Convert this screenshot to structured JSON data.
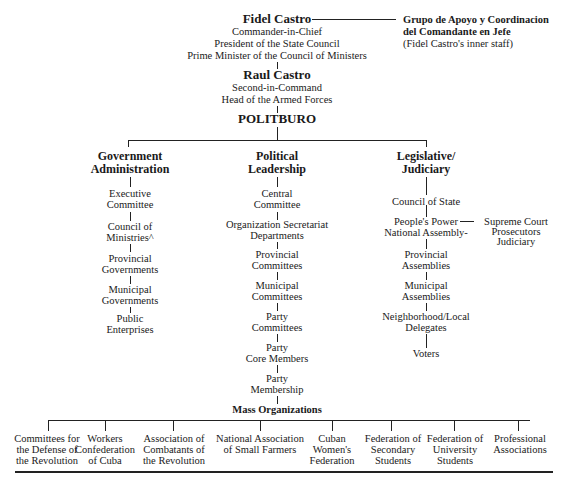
{
  "leader": {
    "name": "Fidel Castro",
    "titles": [
      "Commander-in-Chief",
      "President of the State Council",
      "Prime Minister of the Council of Ministers"
    ]
  },
  "inner_staff": {
    "lines": [
      "Grupo de Apoyo y Coordinacion",
      "del Comandante en Jefe",
      "(Fidel Castro's inner staff)"
    ]
  },
  "second": {
    "name": "Raul Castro",
    "titles": [
      "Second-in-Command",
      "Head of the Armed Forces"
    ]
  },
  "politburo": "POLITBURO",
  "branches": [
    {
      "title": [
        "Government",
        "Administration"
      ],
      "items": [
        [
          "Executive",
          "Committee"
        ],
        [
          "Council of",
          "Ministries^"
        ],
        [
          "Provincial",
          "Governments"
        ],
        [
          "Municipal",
          "Governments"
        ],
        [
          "Public",
          "Enterprises"
        ]
      ]
    },
    {
      "title": [
        "Political",
        "Leadership"
      ],
      "items": [
        [
          "Central",
          "Committee"
        ],
        [
          "Organization Secretariat",
          "Departments"
        ],
        [
          "Provincial",
          "Committees"
        ],
        [
          "Municipal",
          "Committees"
        ],
        [
          "Party",
          "Committees"
        ],
        [
          "Party",
          "Core Members"
        ],
        [
          "Party",
          "Membership"
        ]
      ]
    },
    {
      "title": [
        "Legislative/",
        "Judiciary"
      ],
      "items": [
        [
          "Council of State"
        ],
        [
          "People's Power",
          "National Assembly-"
        ],
        [
          "Provincial",
          "Assemblies"
        ],
        [
          "Municipal",
          "Assemblies"
        ],
        [
          "Neighborhood/Local",
          "Delegates"
        ],
        [
          "Voters"
        ]
      ],
      "side": [
        "Supreme Court",
        "Prosecutors",
        "Judiciary"
      ]
    }
  ],
  "mass_organizations": {
    "title": "Mass Organizations",
    "items": [
      [
        "Committees for",
        "the Defense of",
        "the Revolution"
      ],
      [
        "Workers",
        "Confederation",
        "of Cuba"
      ],
      [
        "Association of",
        "Combatants of",
        "the Revolution"
      ],
      [
        "National Association",
        "of Small Farmers"
      ],
      [
        "Cuban",
        "Women's",
        "Federation"
      ],
      [
        "Federation of",
        "Secondary",
        "Students"
      ],
      [
        "Federation of",
        "University",
        "Students"
      ],
      [
        "Professional",
        "Associations"
      ]
    ]
  }
}
